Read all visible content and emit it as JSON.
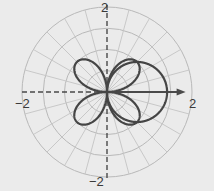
{
  "chart_data": {
    "type": "line",
    "subtype": "polar",
    "title": "",
    "xlabel": "",
    "ylabel": "",
    "rlim": [
      0,
      2
    ],
    "r_grid": [
      0.5,
      1,
      1.5,
      2
    ],
    "theta_grid_step_deg": 15,
    "grid": true,
    "legend": null,
    "tick_labels": {
      "top": "2",
      "bottom": "−2",
      "left": "−2",
      "right": "2"
    },
    "series": [
      {
        "name": "rose",
        "equation": "r = sin(2θ)",
        "amplitude": 1,
        "k": 2,
        "kind": "sin",
        "petals": 4,
        "petal_angles_deg": [
          45,
          135,
          225,
          315
        ],
        "color": "#454545"
      },
      {
        "name": "circle",
        "equation": "r = √2 cos(θ)",
        "diameter": 1.414,
        "kind": "cos-circle",
        "center": [
          0.707,
          0
        ],
        "color": "#454545"
      }
    ],
    "polar_axis": {
      "direction_deg": 0,
      "length": 1.85,
      "arrow": true
    }
  },
  "colors": {
    "background": "#ebebeb",
    "grid": "#b9b9b9",
    "curve": "#454545",
    "axis": "#4a4a4a"
  }
}
